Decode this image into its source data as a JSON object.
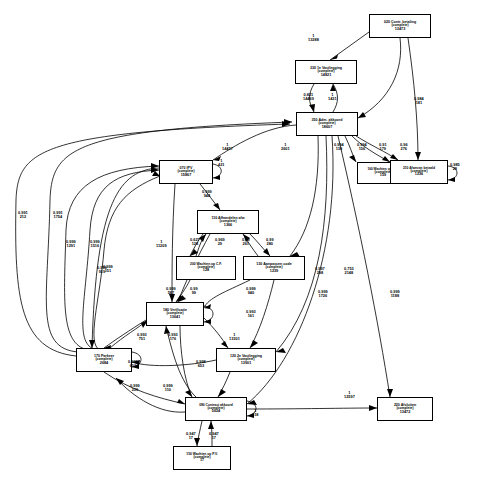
{
  "diagram": {
    "type": "process-mining-graph",
    "background": "#ffffff",
    "stroke": "#000000",
    "width": 477,
    "height": 483
  },
  "nodes": [
    {
      "id": "n020",
      "name": "020 Contr. betaling",
      "state": "(complete)",
      "count": "13473",
      "x": 369,
      "y": 14,
      "w": 62,
      "h": 24
    },
    {
      "id": "n330",
      "name": "330 1e Vastlegging",
      "state": "(complete)",
      "count": "14821",
      "x": 295,
      "y": 60,
      "w": 62,
      "h": 24
    },
    {
      "id": "n350",
      "name": "350 Adm. akkoord",
      "state": "(complete)",
      "count": "18607",
      "x": 296,
      "y": 112,
      "w": 62,
      "h": 24
    },
    {
      "id": "n070",
      "name": "070 IPV",
      "state": "(complete)",
      "count": "15867",
      "x": 159,
      "y": 160,
      "w": 54,
      "h": 24
    },
    {
      "id": "n160",
      "name": "160 Wachten op VPL",
      "state": "(complete)",
      "count": "159",
      "x": 357,
      "y": 162,
      "w": 52,
      "h": 22
    },
    {
      "id": "n210",
      "name": "210 Afwezan betaald",
      "state": "(complete)",
      "count": "1236",
      "x": 390,
      "y": 160,
      "w": 58,
      "h": 24
    },
    {
      "id": "n110",
      "name": "110 Afhandelen afw",
      "state": "(complete)",
      "count": "1366",
      "x": 197,
      "y": 210,
      "w": 62,
      "h": 24
    },
    {
      "id": "n200",
      "name": "200 Wachten op C.F.",
      "state": "(complete)",
      "count": "128",
      "x": 176,
      "y": 256,
      "w": 60,
      "h": 24
    },
    {
      "id": "n130",
      "name": "130 Aanpassen code",
      "state": "(complete)",
      "count": "1239",
      "x": 243,
      "y": 256,
      "w": 62,
      "h": 24
    },
    {
      "id": "n180",
      "name": "180 Verificatie",
      "state": "(complete)",
      "count": "13641",
      "x": 146,
      "y": 302,
      "w": 58,
      "h": 24
    },
    {
      "id": "n170",
      "name": "170 Parkeer",
      "state": "(complete)",
      "count": "2684",
      "x": 76,
      "y": 348,
      "w": 56,
      "h": 24
    },
    {
      "id": "n120",
      "name": "120 2e Vastlegging",
      "state": "(complete)",
      "count": "13901",
      "x": 216,
      "y": 348,
      "w": 60,
      "h": 24
    },
    {
      "id": "n220",
      "name": "220 Afsluiten",
      "state": "(complete)",
      "count": "13472",
      "x": 377,
      "y": 397,
      "w": 56,
      "h": 24
    },
    {
      "id": "n090",
      "name": "090 Contract akkoord",
      "state": "(complete)",
      "count": "5624",
      "x": 185,
      "y": 397,
      "w": 62,
      "h": 24
    },
    {
      "id": "n150",
      "name": "150 Wachten op P.V.",
      "state": "(complete)",
      "count": "17",
      "x": 173,
      "y": 446,
      "w": 58,
      "h": 24
    }
  ],
  "edge_labels": [
    {
      "id": "e1",
      "value": "1",
      "freq": "13288",
      "x": 308,
      "y": 34
    },
    {
      "id": "e2",
      "value": "0,984",
      "freq": "181",
      "x": 414,
      "y": 97
    },
    {
      "id": "e3",
      "value": "0,821",
      "freq": "14469",
      "x": 303,
      "y": 93
    },
    {
      "id": "e4",
      "value": "1",
      "freq": "1421",
      "x": 328,
      "y": 93
    },
    {
      "id": "e5",
      "value": "1",
      "freq": "14457",
      "x": 222,
      "y": 143
    },
    {
      "id": "e6",
      "value": "1",
      "freq": "2601",
      "x": 281,
      "y": 143
    },
    {
      "id": "e7",
      "value": "0,994",
      "freq": "138",
      "x": 334,
      "y": 143
    },
    {
      "id": "e8",
      "value": "0,994",
      "freq": "156",
      "x": 357,
      "y": 143
    },
    {
      "id": "e9",
      "value": "0,91",
      "freq": "179",
      "x": 379,
      "y": 143
    },
    {
      "id": "e10",
      "value": "0,96",
      "freq": "276",
      "x": 400,
      "y": 143
    },
    {
      "id": "e11",
      "value": "1",
      "freq": "421",
      "x": 218,
      "y": 159
    },
    {
      "id": "e12",
      "value": "0,985",
      "freq": "28",
      "x": 450,
      "y": 163
    },
    {
      "id": "e13",
      "value": "0,991",
      "freq": "212",
      "x": 18,
      "y": 211
    },
    {
      "id": "e14",
      "value": "0,991",
      "freq": "1754",
      "x": 53,
      "y": 211
    },
    {
      "id": "e15",
      "value": "0,999",
      "freq": "944",
      "x": 202,
      "y": 190
    },
    {
      "id": "e16",
      "value": "0,999",
      "freq": "1291",
      "x": 66,
      "y": 240
    },
    {
      "id": "e17",
      "value": "0,999",
      "freq": "1516",
      "x": 90,
      "y": 240
    },
    {
      "id": "e18",
      "value": "0,999",
      "freq": "151",
      "x": 103,
      "y": 265
    },
    {
      "id": "e19",
      "value": "1",
      "freq": "11209",
      "x": 156,
      "y": 240
    },
    {
      "id": "e20",
      "value": "0,627",
      "freq": "128",
      "x": 190,
      "y": 238
    },
    {
      "id": "e21",
      "value": "0,969",
      "freq": "29",
      "x": 215,
      "y": 238
    },
    {
      "id": "e22",
      "value": "0,99",
      "freq": "261",
      "x": 242,
      "y": 238
    },
    {
      "id": "e23",
      "value": "0,99",
      "freq": "280",
      "x": 266,
      "y": 238
    },
    {
      "id": "e24",
      "value": "0,999",
      "freq": "919",
      "x": 97,
      "y": 266
    },
    {
      "id": "e25",
      "value": "0,997",
      "freq": "298",
      "x": 315,
      "y": 267
    },
    {
      "id": "e26",
      "value": "0,753",
      "freq": "2148",
      "x": 344,
      "y": 267
    },
    {
      "id": "e27",
      "value": "0,999",
      "freq": "1726",
      "x": 318,
      "y": 290
    },
    {
      "id": "e28",
      "value": "0,999",
      "freq": "1188",
      "x": 390,
      "y": 290
    },
    {
      "id": "e29",
      "value": "0,999",
      "freq": "587",
      "x": 166,
      "y": 287
    },
    {
      "id": "e30",
      "value": "0,99",
      "freq": "99",
      "x": 190,
      "y": 287
    },
    {
      "id": "e31",
      "value": "0,999",
      "freq": "940",
      "x": 246,
      "y": 287
    },
    {
      "id": "e32",
      "value": "0,993",
      "freq": "161",
      "x": 246,
      "y": 310
    },
    {
      "id": "e33",
      "value": "0,993",
      "freq": "751",
      "x": 137,
      "y": 333
    },
    {
      "id": "e34",
      "value": "0,993",
      "freq": "176",
      "x": 168,
      "y": 333
    },
    {
      "id": "e35",
      "value": "0,999",
      "freq": "650",
      "x": 128,
      "y": 360
    },
    {
      "id": "e36",
      "value": "0,998",
      "freq": "653",
      "x": 196,
      "y": 360
    },
    {
      "id": "e37",
      "value": "1",
      "freq": "13301",
      "x": 229,
      "y": 333
    },
    {
      "id": "e38",
      "value": "0,999",
      "freq": "239",
      "x": 130,
      "y": 384
    },
    {
      "id": "e39",
      "value": "0,999",
      "freq": "110",
      "x": 163,
      "y": 384
    },
    {
      "id": "e40",
      "value": "1",
      "freq": "918",
      "x": 252,
      "y": 409
    },
    {
      "id": "e41",
      "value": "1",
      "freq": "12597",
      "x": 344,
      "y": 391
    },
    {
      "id": "e42",
      "value": "0,947",
      "freq": "17",
      "x": 186,
      "y": 432
    },
    {
      "id": "e43",
      "value": "0,947",
      "freq": "17",
      "x": 209,
      "y": 432
    }
  ]
}
